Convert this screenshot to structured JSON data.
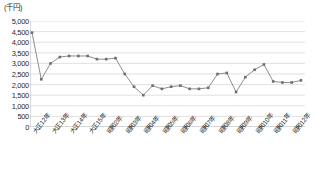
{
  "chart": {
    "unit_label": "(千円)",
    "colors": {
      "line": "#808080",
      "marker": "#6e6e6e",
      "grid": "#c8c8c8",
      "axis": "#9a9a9a",
      "text": "#2a2a2a",
      "background": "#ffffff"
    }
  },
  "chart_data": {
    "type": "line",
    "title": "",
    "xlabel": "",
    "ylabel": "(千円)",
    "ylim": [
      0,
      5000
    ],
    "ytick_values": [
      0,
      500,
      1000,
      1500,
      2000,
      2500,
      3000,
      3500,
      4000,
      4500,
      5000
    ],
    "ytick_labels": [
      "0",
      "500",
      "1,000",
      "1,500",
      "2,000",
      "2,500",
      "3,000",
      "3,500",
      "4,000",
      "4,500",
      "5,000"
    ],
    "grid": true,
    "legend": "none",
    "categories": [
      "大正12年",
      "大正13年",
      "大正14年",
      "大正15年",
      "昭和2年",
      "昭和3年",
      "昭和4年",
      "昭和5年",
      "昭和6年",
      "昭和7年",
      "昭和8年",
      "昭和9年",
      "昭和10年",
      "昭和11年",
      "昭和12年",
      "昭和13年",
      "昭和14年",
      "昭和15年",
      "昭和16年",
      "昭和17年",
      "昭和18年",
      "昭和19年",
      "昭和20年",
      "昭和21年",
      "昭和22年",
      "昭和23年",
      "昭和24年",
      "昭和25年",
      "昭和26年",
      "昭和27年"
    ],
    "xtick_labeled": [
      "大正12年",
      "大正13年",
      "大正14年",
      "大正15年",
      "昭和2年",
      "昭和3年",
      "昭和4年",
      "昭和5年",
      "昭和6年",
      "昭和7年",
      "昭和8年",
      "昭和9年",
      "昭和10年",
      "昭和11年",
      "昭和12年"
    ],
    "values": [
      4450,
      2250,
      3000,
      3300,
      3350,
      3350,
      3350,
      3200,
      3200,
      3250,
      2500,
      1900,
      1500,
      1950,
      1800,
      1900,
      1950,
      1800,
      1800,
      1850,
      2500,
      2550,
      1650,
      2350,
      2700,
      2950,
      2150,
      2100,
      2100,
      2200
    ],
    "series_tail": [
      2350,
      2500,
      2550,
      2700,
      3050
    ]
  }
}
